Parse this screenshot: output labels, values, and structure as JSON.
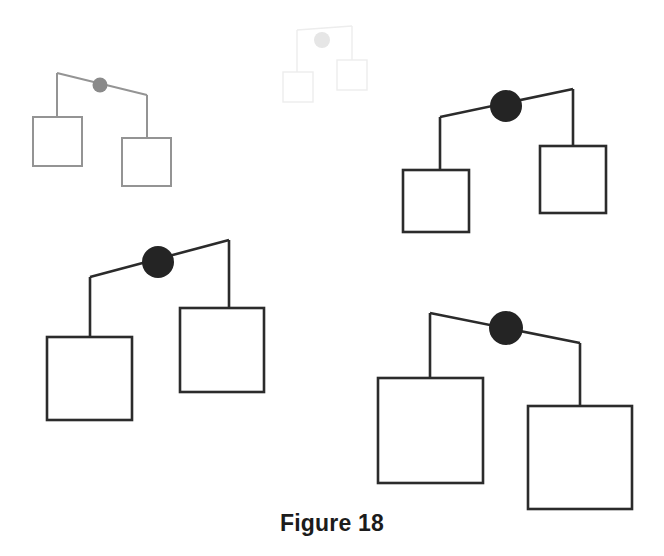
{
  "figure": {
    "caption": "Figure 18",
    "background_color": "#ffffff",
    "width": 664,
    "height": 556,
    "node_shape": "circle",
    "leaf_shape": "square"
  },
  "chart_data": {
    "type": "diagram",
    "title": "Figure 18",
    "subtitle": "",
    "xlabel": "",
    "ylabel": "",
    "units": "pixels",
    "grid": false,
    "legend": false,
    "coordinate_space": {
      "x": [
        0,
        664
      ],
      "y": [
        0,
        556
      ],
      "origin": "top-left"
    },
    "palette": {
      "faintest": "#eeeeee",
      "light_gray": "#949494",
      "dark": "#2b2b2b",
      "black": "#1c1c1c",
      "background": "#ffffff"
    },
    "series": [
      {
        "name": "mobile-1-faintest",
        "order": 1,
        "scale": 0.62,
        "tone": "faintest",
        "stroke_color": "#ededed",
        "node_fill": "#e6e6e6",
        "stroke_width": 1.4,
        "node": {
          "cx": 322,
          "cy": 40,
          "r": 8
        },
        "beam": {
          "x1": 297,
          "y1": 30,
          "x2": 352,
          "y2": 26
        },
        "left_drop": {
          "x": 297,
          "y1": 30,
          "y2": 72
        },
        "right_drop": {
          "x": 352,
          "y1": 26,
          "y2": 60
        },
        "left_box": {
          "x": 283,
          "y": 72,
          "w": 30,
          "h": 30
        },
        "right_box": {
          "x": 337,
          "y": 60,
          "w": 30,
          "h": 30
        }
      },
      {
        "name": "mobile-2-light",
        "order": 2,
        "scale": 0.74,
        "tone": "light_gray",
        "stroke_color": "#949494",
        "node_fill": "#8a8a8a",
        "stroke_width": 2.0,
        "node": {
          "cx": 100,
          "cy": 85,
          "r": 7.5
        },
        "beam": {
          "x1": 57,
          "y1": 73,
          "x2": 147,
          "y2": 95
        },
        "left_drop": {
          "x": 57,
          "y1": 73,
          "y2": 117
        },
        "right_drop": {
          "x": 147,
          "y1": 95,
          "y2": 138
        },
        "left_box": {
          "x": 33,
          "y": 117,
          "w": 49,
          "h": 49
        },
        "right_box": {
          "x": 122,
          "y": 138,
          "w": 49,
          "h": 48
        }
      },
      {
        "name": "mobile-3-dark-upper-right",
        "order": 3,
        "scale": 1.0,
        "tone": "dark",
        "stroke_color": "#2b2b2b",
        "node_fill": "#242424",
        "stroke_width": 2.6,
        "node": {
          "cx": 506,
          "cy": 106,
          "r": 16
        },
        "beam": {
          "x1": 440,
          "y1": 117,
          "x2": 573,
          "y2": 89
        },
        "left_drop": {
          "x": 440,
          "y1": 117,
          "y2": 170
        },
        "right_drop": {
          "x": 573,
          "y1": 89,
          "y2": 146
        },
        "left_box": {
          "x": 403,
          "y": 170,
          "w": 66,
          "h": 62
        },
        "right_box": {
          "x": 540,
          "y": 146,
          "w": 66,
          "h": 67
        }
      },
      {
        "name": "mobile-4-dark-lower-left",
        "order": 4,
        "scale": 1.25,
        "tone": "dark",
        "stroke_color": "#2b2b2b",
        "node_fill": "#242424",
        "stroke_width": 2.6,
        "node": {
          "cx": 158,
          "cy": 262,
          "r": 16
        },
        "beam": {
          "x1": 90,
          "y1": 277,
          "x2": 229,
          "y2": 240
        },
        "left_drop": {
          "x": 90,
          "y1": 277,
          "y2": 337
        },
        "right_drop": {
          "x": 229,
          "y1": 240,
          "y2": 308
        },
        "left_box": {
          "x": 47,
          "y": 337,
          "w": 85,
          "h": 83
        },
        "right_box": {
          "x": 180,
          "y": 308,
          "w": 84,
          "h": 84
        }
      },
      {
        "name": "mobile-5-dark-lower-right",
        "order": 5,
        "scale": 1.5,
        "tone": "dark",
        "stroke_color": "#2b2b2b",
        "node_fill": "#242424",
        "stroke_width": 2.6,
        "node": {
          "cx": 506,
          "cy": 328,
          "r": 17
        },
        "beam": {
          "x1": 430,
          "y1": 313,
          "x2": 580,
          "y2": 343
        },
        "left_drop": {
          "x": 430,
          "y1": 313,
          "y2": 378
        },
        "right_drop": {
          "x": 580,
          "y1": 343,
          "y2": 406
        },
        "left_box": {
          "x": 378,
          "y": 378,
          "w": 105,
          "h": 105
        },
        "right_box": {
          "x": 528,
          "y": 406,
          "w": 104,
          "h": 103
        }
      }
    ],
    "annotations": [
      {
        "text": "Figure 18",
        "x": 332,
        "y": 525,
        "anchor": "middle",
        "bold": true
      }
    ]
  }
}
